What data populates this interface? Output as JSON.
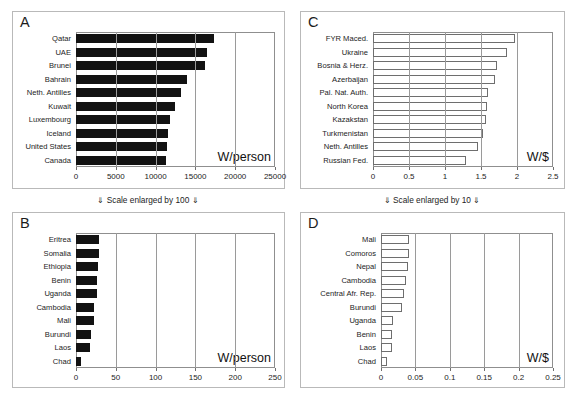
{
  "figure": {
    "notes": [
      {
        "text": "⇓ Scale enlarged by 100 ⇓"
      },
      {
        "text": "⇓ Scale enlarged by 10 ⇓"
      }
    ]
  },
  "chart_data": [
    {
      "id": "A",
      "type": "bar",
      "orientation": "horizontal",
      "panel_letter": "A",
      "title": "",
      "xlabel": "W/person",
      "ylabel": "",
      "unit_label": "W/person",
      "xlim": [
        0,
        25000
      ],
      "xticks": [
        0,
        5000,
        10000,
        15000,
        20000,
        25000
      ],
      "xtick_labels": [
        "0",
        "5000",
        "10000",
        "15000",
        "20000",
        "25000"
      ],
      "grid": true,
      "bar_style": "filled",
      "legend": "none",
      "categories": [
        "Qatar",
        "UAE",
        "Brunei",
        "Bahrain",
        "Neth. Antilles",
        "Kuwait",
        "Luxembourg",
        "Iceland",
        "United States",
        "Canada"
      ],
      "values": [
        17300,
        16400,
        16150,
        13900,
        13200,
        12400,
        11800,
        11500,
        11400,
        11300
      ]
    },
    {
      "id": "B",
      "type": "bar",
      "orientation": "horizontal",
      "panel_letter": "B",
      "title": "",
      "xlabel": "W/person",
      "ylabel": "",
      "unit_label": "W/person",
      "xlim": [
        0,
        250
      ],
      "xticks": [
        0,
        50,
        100,
        150,
        200,
        250
      ],
      "xtick_labels": [
        "0",
        "50",
        "100",
        "150",
        "200",
        "250"
      ],
      "grid": true,
      "bar_style": "filled",
      "legend": "none",
      "categories": [
        "Eritrea",
        "Somalia",
        "Ethiopia",
        "Benin",
        "Uganda",
        "Cambodia",
        "Mali",
        "Burundi",
        "Laos",
        "Chad"
      ],
      "values": [
        29,
        29,
        28,
        27,
        26.5,
        23,
        22,
        19,
        17,
        6
      ]
    },
    {
      "id": "C",
      "type": "bar",
      "orientation": "horizontal",
      "panel_letter": "C",
      "title": "",
      "xlabel": "W/$",
      "ylabel": "",
      "unit_label": "W/$",
      "xlim": [
        0,
        2.5
      ],
      "xticks": [
        0,
        0.5,
        1,
        1.5,
        2,
        2.5
      ],
      "xtick_labels": [
        "0",
        "0.5",
        "1",
        "1.5",
        "2",
        "2.5"
      ],
      "grid": true,
      "bar_style": "open",
      "legend": "none",
      "categories": [
        "FYR Maced.",
        "Ukraine",
        "Bosnia & Herz.",
        "Azerbaijan",
        "Pal. Nat. Auth.",
        "North Korea",
        "Kazakstan",
        "Turkmenistan",
        "Neth. Antilles",
        "Russian Fed."
      ],
      "values": [
        1.97,
        1.86,
        1.72,
        1.69,
        1.6,
        1.58,
        1.57,
        1.53,
        1.46,
        1.29
      ]
    },
    {
      "id": "D",
      "type": "bar",
      "orientation": "horizontal",
      "panel_letter": "D",
      "title": "",
      "xlabel": "W/$",
      "ylabel": "",
      "unit_label": "W/$",
      "xlim": [
        0,
        0.25
      ],
      "xticks": [
        0,
        0.05,
        0.1,
        0.15,
        0.2,
        0.25
      ],
      "xtick_labels": [
        "0",
        "0.05",
        "0.1",
        "0.15",
        "0.2",
        "0.25"
      ],
      "grid": true,
      "bar_style": "open",
      "legend": "none",
      "categories": [
        "Mali",
        "Comoros",
        "Nepal",
        "Cambodia",
        "Central Afr. Rep.",
        "Burundi",
        "Uganda",
        "Benin",
        "Laos",
        "Chad"
      ],
      "values": [
        0.041,
        0.04,
        0.039,
        0.036,
        0.034,
        0.031,
        0.018,
        0.016,
        0.0155,
        0.009
      ]
    }
  ]
}
